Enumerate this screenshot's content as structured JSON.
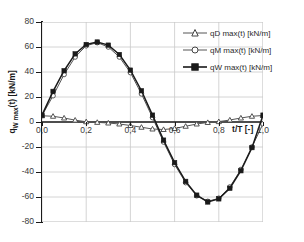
{
  "chart_data": {
    "type": "line",
    "title": "",
    "xlabel": "t/T [-]",
    "ylabel": "qW max(t) [kN/m]",
    "ylabel_main": "q",
    "ylabel_sub": "W max",
    "ylabel_rest": "(t) [kN/m]",
    "xlim": [
      0.0,
      1.0
    ],
    "ylim": [
      -80,
      80
    ],
    "grid": true,
    "legend_position": "inside-top-right",
    "x_ticks": [
      "0,0",
      "0,2",
      "0,4",
      "0,6",
      "0,8",
      "1,0"
    ],
    "x_tick_values": [
      0.0,
      0.2,
      0.4,
      0.6,
      0.8,
      1.0
    ],
    "y_ticks": [
      "80",
      "60",
      "40",
      "20",
      "0",
      "-20",
      "-40",
      "-60",
      "-80"
    ],
    "y_tick_values": [
      80,
      60,
      40,
      20,
      0,
      -20,
      -40,
      -60,
      -80
    ],
    "x": [
      0.0,
      0.05,
      0.1,
      0.15,
      0.2,
      0.25,
      0.3,
      0.35,
      0.4,
      0.45,
      0.5,
      0.55,
      0.6,
      0.65,
      0.7,
      0.75,
      0.8,
      0.85,
      0.9,
      0.95,
      1.0
    ],
    "series": [
      {
        "name": "qD max(t) [kN/m]",
        "marker": "triangle-open",
        "color": "#555555",
        "values": [
          5.0,
          4.6,
          3.2,
          1.5,
          0.2,
          -0.3,
          -0.8,
          -1.6,
          -2.8,
          -4.2,
          -5.6,
          -6.0,
          -5.2,
          -3.4,
          -1.6,
          -0.4,
          0.3,
          1.6,
          3.2,
          4.6,
          5.2
        ]
      },
      {
        "name": "qM max(t) [kN/m]",
        "marker": "circle-open",
        "color": "#555555",
        "values": [
          5.2,
          21.0,
          38.0,
          52.0,
          61.0,
          63.5,
          60.0,
          52.0,
          39.5,
          22.5,
          3.5,
          -16.0,
          -34.0,
          -48.5,
          -59.0,
          -63.5,
          -61.0,
          -52.0,
          -38.0,
          -20.0,
          -1.5
        ]
      },
      {
        "name": "qW max(t) [kN/m]",
        "marker": "square-filled",
        "color": "#1a1a1a",
        "values": [
          5.5,
          24.5,
          41.0,
          54.5,
          62.0,
          64.0,
          61.5,
          54.0,
          41.5,
          25.0,
          5.5,
          -14.5,
          -32.5,
          -47.5,
          -58.5,
          -64.0,
          -61.5,
          -53.0,
          -39.0,
          -20.5,
          5.5
        ]
      }
    ]
  },
  "legend": {
    "items": [
      {
        "label": "qD max(t) [kN/m]"
      },
      {
        "label": "qM max(t) [kN/m]"
      },
      {
        "label": "qW max(t) [kN/m]"
      }
    ]
  }
}
